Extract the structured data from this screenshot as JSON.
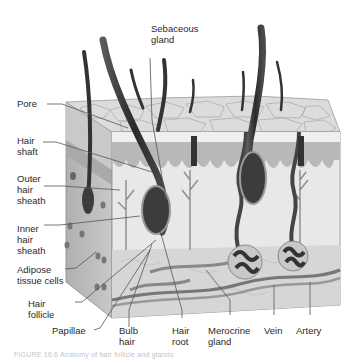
{
  "figure": {
    "caption": "FIGURE 16.6  Anatomy of hair follicle and glands"
  },
  "labels": {
    "sebaceous_gland": "Sebaceous\ngland",
    "pore": "Pore",
    "hair_shaft": "Hair\nshaft",
    "outer_hair_sheath": "Outer\nhair\nsheath",
    "inner_hair_sheath": "Inner\nhair\nsheath",
    "adipose_tissue_cells": "Adipose\ntissue cells",
    "hair_follicle": "Hair\nfollicle",
    "papillae": "Papillae",
    "bulb_hair": "Bulb\nhair",
    "hair_root": "Hair\nroot",
    "merocrine_gland": "Merocrine\ngland",
    "vein": "Vein",
    "artery": "Artery"
  },
  "colors": {
    "epidermis_top": "#d9d9d9",
    "dermis": "#bdbdbd",
    "hair": "#3a3a3a",
    "leader_line": "#555555"
  }
}
